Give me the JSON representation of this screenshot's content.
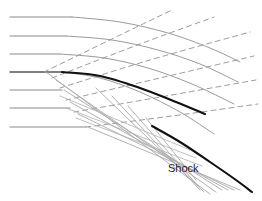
{
  "figure": {
    "background_color": "#ffffff",
    "width": 262,
    "height": 201
  },
  "labels": [
    {
      "id": "shock",
      "text": "Shock",
      "x": 168,
      "y": 172,
      "font_size": 11,
      "color": "#1a1a1a"
    }
  ],
  "chart_data": {
    "type": "line",
    "xlabel": "",
    "ylabel": "",
    "grid": false,
    "legend": null,
    "xlim": [
      0,
      262
    ],
    "ylim": [
      0,
      201
    ],
    "annotations": [
      {
        "text": "Shock",
        "x": 168,
        "y": 172
      }
    ],
    "series": [
      {
        "name": "incoming-streamline-1",
        "style": "solid",
        "color": "#8a8a8a",
        "width": 1,
        "points": [
          [
            10,
            17
          ],
          [
            72,
            17
          ]
        ]
      },
      {
        "name": "incoming-streamline-2",
        "style": "solid",
        "color": "#8a8a8a",
        "width": 1,
        "points": [
          [
            10,
            36
          ],
          [
            66,
            36
          ]
        ]
      },
      {
        "name": "incoming-streamline-3",
        "style": "solid",
        "color": "#8a8a8a",
        "width": 1,
        "points": [
          [
            10,
            54
          ],
          [
            60,
            54
          ]
        ]
      },
      {
        "name": "incoming-streamline-4",
        "style": "solid",
        "color": "#555555",
        "width": 1.4,
        "points": [
          [
            10,
            72
          ],
          [
            62,
            72
          ]
        ]
      },
      {
        "name": "incoming-streamline-5",
        "style": "solid",
        "color": "#8a8a8a",
        "width": 1,
        "points": [
          [
            10,
            90
          ],
          [
            62,
            90
          ]
        ]
      },
      {
        "name": "incoming-streamline-6",
        "style": "solid",
        "color": "#8a8a8a",
        "width": 1,
        "points": [
          [
            10,
            108
          ],
          [
            70,
            108
          ]
        ]
      },
      {
        "name": "incoming-streamline-7",
        "style": "solid",
        "color": "#8a8a8a",
        "width": 1,
        "points": [
          [
            10,
            127
          ],
          [
            86,
            127
          ]
        ]
      },
      {
        "name": "characteristic-curve-1",
        "style": "solid",
        "color": "#9a9a9a",
        "width": 1,
        "points": [
          [
            72,
            17
          ],
          [
            120,
            22
          ],
          [
            168,
            33
          ],
          [
            210,
            48
          ],
          [
            240,
            62
          ]
        ]
      },
      {
        "name": "characteristic-curve-2",
        "style": "solid",
        "color": "#9a9a9a",
        "width": 1,
        "points": [
          [
            66,
            36
          ],
          [
            112,
            40
          ],
          [
            158,
            50
          ],
          [
            200,
            64
          ],
          [
            238,
            82
          ]
        ]
      },
      {
        "name": "characteristic-curve-3",
        "style": "solid",
        "color": "#9a9a9a",
        "width": 1,
        "points": [
          [
            60,
            54
          ],
          [
            104,
            58
          ],
          [
            148,
            68
          ],
          [
            192,
            84
          ],
          [
            234,
            104
          ]
        ]
      },
      {
        "name": "characteristic-curve-4",
        "style": "solid",
        "color": "#9a9a9a",
        "width": 1,
        "points": [
          [
            62,
            72
          ],
          [
            100,
            78
          ],
          [
            140,
            92
          ],
          [
            180,
            112
          ],
          [
            214,
            134
          ]
        ]
      },
      {
        "name": "mach-line-1",
        "style": "dashed",
        "color": "#9a9a9a",
        "width": 1,
        "points": [
          [
            44,
            72
          ],
          [
            118,
            36
          ],
          [
            172,
            10
          ]
        ]
      },
      {
        "name": "mach-line-2",
        "style": "dashed",
        "color": "#9a9a9a",
        "width": 1,
        "points": [
          [
            52,
            78
          ],
          [
            140,
            44
          ],
          [
            214,
            17
          ]
        ]
      },
      {
        "name": "mach-line-3",
        "style": "dashed",
        "color": "#9a9a9a",
        "width": 1,
        "points": [
          [
            60,
            88
          ],
          [
            150,
            60
          ],
          [
            250,
            32
          ]
        ]
      },
      {
        "name": "mach-line-4",
        "style": "dashed",
        "color": "#9a9a9a",
        "width": 1,
        "points": [
          [
            66,
            100
          ],
          [
            160,
            78
          ],
          [
            254,
            56
          ]
        ]
      },
      {
        "name": "mach-line-5",
        "style": "dashed",
        "color": "#9a9a9a",
        "width": 1,
        "points": [
          [
            74,
            112
          ],
          [
            166,
            96
          ],
          [
            256,
            80
          ]
        ]
      },
      {
        "name": "mach-line-6",
        "style": "dashed",
        "color": "#9a9a9a",
        "width": 1,
        "points": [
          [
            86,
            127
          ],
          [
            172,
            116
          ],
          [
            258,
            104
          ]
        ]
      },
      {
        "name": "converging-ray-1",
        "style": "solid",
        "color": "#a8a8a8",
        "width": 0.9,
        "points": [
          [
            46,
            72
          ],
          [
            210,
            194
          ]
        ]
      },
      {
        "name": "converging-ray-2",
        "style": "solid",
        "color": "#a8a8a8",
        "width": 0.9,
        "points": [
          [
            56,
            80
          ],
          [
            216,
            192
          ]
        ]
      },
      {
        "name": "converging-ray-3",
        "style": "solid",
        "color": "#a8a8a8",
        "width": 0.9,
        "points": [
          [
            64,
            90
          ],
          [
            222,
            190
          ]
        ]
      },
      {
        "name": "converging-ray-4",
        "style": "solid",
        "color": "#a8a8a8",
        "width": 0.9,
        "points": [
          [
            70,
            102
          ],
          [
            228,
            190
          ]
        ]
      },
      {
        "name": "converging-ray-5",
        "style": "solid",
        "color": "#a8a8a8",
        "width": 0.9,
        "points": [
          [
            78,
            114
          ],
          [
            234,
            190
          ]
        ]
      },
      {
        "name": "converging-ray-6",
        "style": "solid",
        "color": "#a8a8a8",
        "width": 0.9,
        "points": [
          [
            88,
            127
          ],
          [
            240,
            190
          ]
        ]
      },
      {
        "name": "reflected-ray-1",
        "style": "solid",
        "color": "#a8a8a8",
        "width": 0.9,
        "points": [
          [
            96,
            88
          ],
          [
            204,
            192
          ]
        ]
      },
      {
        "name": "reflected-ray-2",
        "style": "solid",
        "color": "#a8a8a8",
        "width": 0.9,
        "points": [
          [
            112,
            96
          ],
          [
            200,
            190
          ]
        ]
      },
      {
        "name": "reflected-ray-3",
        "style": "solid",
        "color": "#a8a8a8",
        "width": 0.9,
        "points": [
          [
            128,
            106
          ],
          [
            198,
            186
          ]
        ]
      },
      {
        "name": "reflected-ray-4",
        "style": "solid",
        "color": "#a8a8a8",
        "width": 0.9,
        "points": [
          [
            146,
            118
          ],
          [
            196,
            180
          ]
        ]
      },
      {
        "name": "crossing-ray-1",
        "style": "solid",
        "color": "#b0b0b0",
        "width": 0.8,
        "points": [
          [
            60,
            96
          ],
          [
            190,
            150
          ]
        ]
      },
      {
        "name": "crossing-ray-2",
        "style": "solid",
        "color": "#b0b0b0",
        "width": 0.8,
        "points": [
          [
            66,
            108
          ],
          [
            196,
            158
          ]
        ]
      },
      {
        "name": "crossing-ray-3",
        "style": "solid",
        "color": "#b0b0b0",
        "width": 0.8,
        "points": [
          [
            76,
            118
          ],
          [
            202,
            166
          ]
        ]
      },
      {
        "name": "shock-curve-upper",
        "style": "solid",
        "color": "#101010",
        "width": 2.1,
        "points": [
          [
            62,
            72
          ],
          [
            100,
            76
          ],
          [
            140,
            88
          ],
          [
            176,
            102
          ],
          [
            205,
            114
          ]
        ]
      },
      {
        "name": "shock-curve-lower",
        "style": "solid",
        "color": "#101010",
        "width": 2.1,
        "points": [
          [
            152,
            126
          ],
          [
            180,
            142
          ],
          [
            210,
            162
          ],
          [
            236,
            180
          ],
          [
            252,
            192
          ]
        ]
      }
    ]
  }
}
